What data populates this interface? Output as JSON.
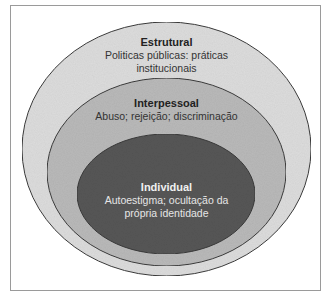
{
  "diagram": {
    "type": "nested-ellipses",
    "levels": [
      {
        "id": "estrutural",
        "title": "Estrutural",
        "description": "Politicas públicas: práticas institucionais",
        "fill": "#dcdcdc"
      },
      {
        "id": "interpessoal",
        "title": "Interpessoal",
        "description": "Abuso; rejeição; discriminação",
        "fill": "#b9b9b9"
      },
      {
        "id": "individual",
        "title": "Individual",
        "description": "Autoestigma; ocultação da própria identidade",
        "fill": "#565656"
      }
    ],
    "stroke": "#3a3a3a",
    "frame_border": "#9a9a9a"
  }
}
